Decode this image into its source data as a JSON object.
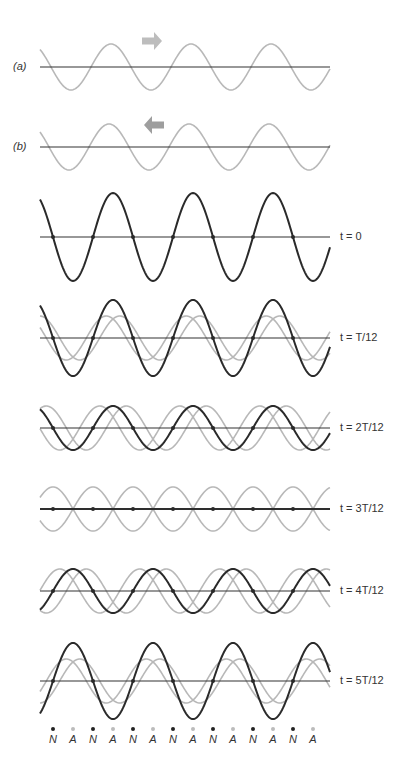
{
  "figure": {
    "colors": {
      "incident_wave": "#b8b8b8",
      "arrow_right": "#bdbdbd",
      "arrow_left": "#9e9e9e",
      "resultant": "#2a2a2a",
      "axis": "#333333"
    },
    "wavelength_px": 80,
    "x_start": 40,
    "x_end": 330
  },
  "panels": [
    {
      "id": "a",
      "label": "(a)",
      "axis_y": 67,
      "amp": 23,
      "phase": 0,
      "arrow": "right"
    },
    {
      "id": "b",
      "label": "(b)",
      "axis_y": 147,
      "amp": 23,
      "phase": 0,
      "arrow": "left"
    }
  ],
  "time_panels": [
    {
      "label": "t = 0",
      "axis_y": 237,
      "k": 0
    },
    {
      "label": "t = T/12",
      "axis_y": 338,
      "k": 1
    },
    {
      "label": "t = 2T/12",
      "axis_y": 428,
      "k": 2
    },
    {
      "label": "t = 3T/12",
      "axis_y": 509,
      "k": 3
    },
    {
      "label": "t = 4T/12",
      "axis_y": 591,
      "k": 4
    },
    {
      "label": "t = 5T/12",
      "axis_y": 681,
      "k": 5
    }
  ],
  "node_antinode_row": {
    "labels": [
      "N",
      "A",
      "N",
      "A",
      "N",
      "A",
      "N",
      "A",
      "N",
      "A",
      "N",
      "A",
      "N",
      "A"
    ],
    "node_color": "#222222",
    "antinode_color": "#bbbbbb"
  },
  "panel_labels": {
    "a": "(a)",
    "b": "(b)",
    "t0": "t = 0",
    "t1": "t = T/12",
    "t2": "t = 2T/12",
    "t3": "t = 3T/12",
    "t4": "t = 4T/12",
    "t5": "t = 5T/12"
  }
}
